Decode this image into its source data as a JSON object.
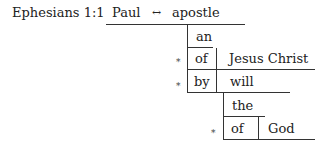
{
  "diagram": {
    "reference": "Ephesians 1:1",
    "subject": "Paul",
    "connector": "↔",
    "predicate": "apostle",
    "modifiers": [
      {
        "word": "an"
      },
      {
        "marker": "*",
        "preposition": "of",
        "object": "Jesus Christ"
      },
      {
        "marker": "*",
        "preposition": "by",
        "object": "will",
        "modifiers": [
          {
            "word": "the"
          },
          {
            "marker": "*",
            "preposition": "of",
            "object": "God"
          }
        ]
      }
    ]
  }
}
